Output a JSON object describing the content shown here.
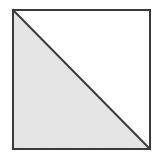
{
  "figure": {
    "canvas": {
      "width": 159,
      "height": 161,
      "background_color": "#ffffff"
    },
    "square": {
      "name": "outer-square",
      "left": 13,
      "top": 10,
      "width": 137,
      "height": 139,
      "stroke_color": "#3a3a3a",
      "stroke_width": 2,
      "fill_color": "#ffffff"
    },
    "diagonal": {
      "name": "diagonal-line",
      "from_corner": "top-left",
      "to_corner": "bottom-right",
      "x1": 13,
      "y1": 10,
      "x2": 150,
      "y2": 149,
      "stroke_color": "#3a3a3a",
      "stroke_width": 2
    },
    "shaded_region": {
      "name": "lower-left-triangle",
      "vertices": "13,10 13,149 150,149",
      "fill_color": "#e6e6e6",
      "label": "shaded"
    },
    "unshaded_region": {
      "name": "upper-right-triangle",
      "vertices": "13,10 150,10 150,149",
      "fill_color": "#ffffff",
      "label": "unshaded"
    }
  }
}
